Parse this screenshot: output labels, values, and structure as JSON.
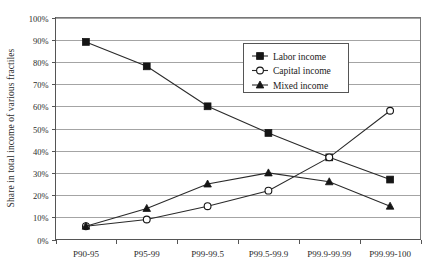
{
  "chart_data": {
    "type": "line",
    "title": "",
    "xlabel": "",
    "ylabel": "Share in total income of various fractiles",
    "categories": [
      "P90-95",
      "P95-99",
      "P99-99.5",
      "P99.5-99.9",
      "P99.9-99.99",
      "P99.99-100"
    ],
    "ylim": [
      0,
      100
    ],
    "ytick_labels": [
      "0%",
      "10%",
      "20%",
      "30%",
      "40%",
      "50%",
      "60%",
      "70%",
      "80%",
      "90%",
      "100%"
    ],
    "ytick_values": [
      0,
      10,
      20,
      30,
      40,
      50,
      60,
      70,
      80,
      90,
      100
    ],
    "grid": true,
    "legend_position": "upper-right-inside",
    "series": [
      {
        "name": "Labor income",
        "marker": "filled-square",
        "values": [
          89,
          78,
          60,
          48,
          37,
          27
        ]
      },
      {
        "name": "Capital income",
        "marker": "open-circle",
        "values": [
          6,
          9,
          15,
          22,
          37,
          58
        ]
      },
      {
        "name": "Mixed income",
        "marker": "filled-triangle",
        "values": [
          6,
          14,
          25,
          30,
          26,
          15
        ]
      }
    ],
    "colors": {
      "line": "#2a2a2a",
      "grid": "#9a9a9a",
      "frame": "#777777",
      "background": "#ffffff",
      "text": "#2b2b2b"
    }
  }
}
